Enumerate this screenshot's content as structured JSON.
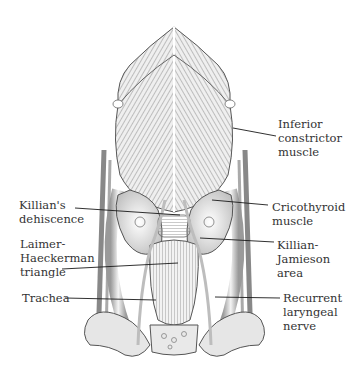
{
  "figure": {
    "colors": {
      "ink": "#333333",
      "leader": "#1a1a1a",
      "background": "#ffffff",
      "shade_dark": "#6e6e6e",
      "shade_light": "#d9d9d9"
    }
  },
  "labels": {
    "inferior_constrictor": {
      "line1": "Inferior",
      "line2": "constrictor",
      "line3": "muscle"
    },
    "killians_dehiscence": {
      "line1": "Killian's",
      "line2": "dehiscence"
    },
    "cricothyroid": {
      "line1": "Cricothyroid",
      "line2": "muscle"
    },
    "laimer_haeckerman": {
      "line1": "Laimer-",
      "line2": "Haeckerman",
      "line3": "triangle"
    },
    "killian_jamieson": {
      "line1": "Killian-",
      "line2": "Jamieson",
      "line3": "area"
    },
    "trachea": {
      "line1": "Trachea"
    },
    "recurrent_laryngeal": {
      "line1": "Recurrent",
      "line2": "laryngeal",
      "line3": "nerve"
    }
  }
}
